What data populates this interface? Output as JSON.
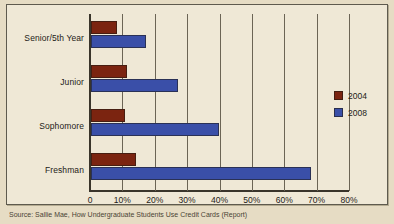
{
  "figure": {
    "background_color": "#EFE8D6",
    "page_color": "#E6DCC4",
    "frame_color": "#5E5A4E",
    "source_note": "Source: Sallie Mae, How Undergraduate Students Use Credit Cards (Report)"
  },
  "legend": {
    "position": "right",
    "entries": [
      {
        "label": "2004",
        "color": "#7B2410"
      },
      {
        "label": "2008",
        "color": "#3A4FA8"
      }
    ]
  },
  "chart_data": {
    "type": "bar",
    "orientation": "horizontal",
    "title": "",
    "subtitle": "",
    "xlabel": "",
    "ylabel": "",
    "xlim": [
      0,
      80
    ],
    "xtick_values": [
      0,
      10,
      20,
      30,
      40,
      50,
      60,
      70,
      80
    ],
    "xtick_labels": [
      "0",
      "10%",
      "20%",
      "30%",
      "40%",
      "50%",
      "60%",
      "70%",
      "80%"
    ],
    "grid": true,
    "grid_axis": "x",
    "legend_position": "right",
    "categories": [
      "Senior/5th Year",
      "Junior",
      "Sophomore",
      "Freshman"
    ],
    "series": [
      {
        "name": "2004",
        "color": "#7B2410",
        "values": [
          8,
          11,
          10.5,
          14
        ]
      },
      {
        "name": "2008",
        "color": "#3A4FA8",
        "values": [
          17,
          27,
          39.5,
          68
        ]
      }
    ]
  }
}
